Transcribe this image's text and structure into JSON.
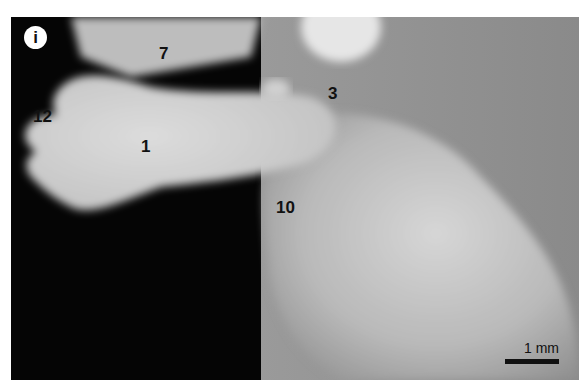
{
  "figure": {
    "panel_label": "i",
    "structure_labels": [
      {
        "id": "label-7",
        "text": "7"
      },
      {
        "id": "label-3",
        "text": "3"
      },
      {
        "id": "label-12",
        "text": "12"
      },
      {
        "id": "label-1",
        "text": "1"
      },
      {
        "id": "label-10",
        "text": "10"
      }
    ],
    "scale_bar": {
      "text": "1 mm"
    },
    "colors": {
      "background": "#050505",
      "tissue_light": "#d9d9d9",
      "tissue_mid": "#a8a8a8",
      "tissue_dark": "#8a8a8a"
    }
  }
}
